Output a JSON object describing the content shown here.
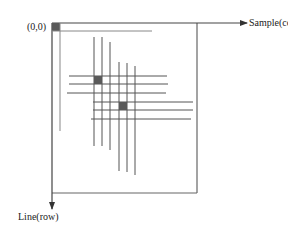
{
  "labels": {
    "origin": "(0,0)",
    "x_axis": "Sample(col)",
    "y_axis": "Line(row)"
  },
  "colors": {
    "line": "#555555",
    "frame": "#666666",
    "square": "#5a5a5a",
    "text": "#222222"
  }
}
